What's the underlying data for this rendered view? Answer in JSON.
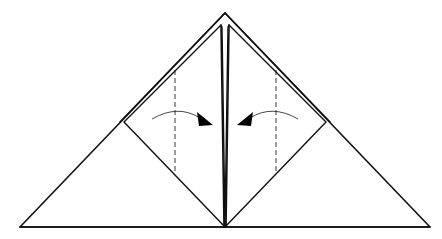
{
  "diagram": {
    "type": "origami-fold-step",
    "colors": {
      "line": "#111111",
      "background": "#ffffff",
      "arrowhead": "#000000"
    },
    "shapes": {
      "outer_triangle": {
        "apex": [
          225,
          13
        ],
        "bottom_left": [
          20,
          227
        ],
        "bottom_right": [
          430,
          227
        ]
      },
      "left_square": {
        "top": [
          221,
          25
        ],
        "left": [
          124,
          122
        ],
        "bottom": [
          225,
          227
        ],
        "right_edge_x": 223
      },
      "right_square": {
        "top": [
          229,
          25
        ],
        "right": [
          326,
          122
        ],
        "bottom": [
          225,
          227
        ],
        "left_edge_x": 227
      }
    },
    "fold_lines": [
      {
        "name": "left-valley-fold",
        "style": "dashed",
        "x": 175,
        "y1": 70,
        "y2": 172
      },
      {
        "name": "right-valley-fold",
        "style": "dashed",
        "x": 276,
        "y1": 70,
        "y2": 172
      }
    ],
    "arrows": [
      {
        "name": "left-fold-arrow",
        "direction": "right",
        "from": [
          152,
          118
        ],
        "to": [
          212,
          126
        ]
      },
      {
        "name": "right-fold-arrow",
        "direction": "left",
        "from": [
          298,
          118
        ],
        "to": [
          238,
          126
        ]
      }
    ]
  }
}
